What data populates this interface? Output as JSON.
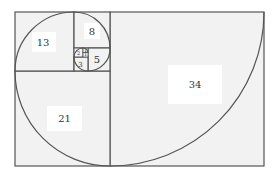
{
  "diagram": {
    "type": "fibonacci-spiral",
    "colors": {
      "square_fill": "#f2f2f2",
      "label_box": "#ffffff",
      "line": "#555555",
      "text": "#333333"
    },
    "squares": [
      {
        "id": "sq34",
        "label": "34"
      },
      {
        "id": "sq21",
        "label": "21"
      },
      {
        "id": "sq13",
        "label": "13"
      },
      {
        "id": "sq8",
        "label": "8"
      },
      {
        "id": "sq5",
        "label": "5"
      },
      {
        "id": "sq3",
        "label": "3"
      },
      {
        "id": "sq2",
        "label": "2"
      },
      {
        "id": "sq1a",
        "label": "1"
      },
      {
        "id": "sq1b",
        "label": "1"
      }
    ]
  }
}
